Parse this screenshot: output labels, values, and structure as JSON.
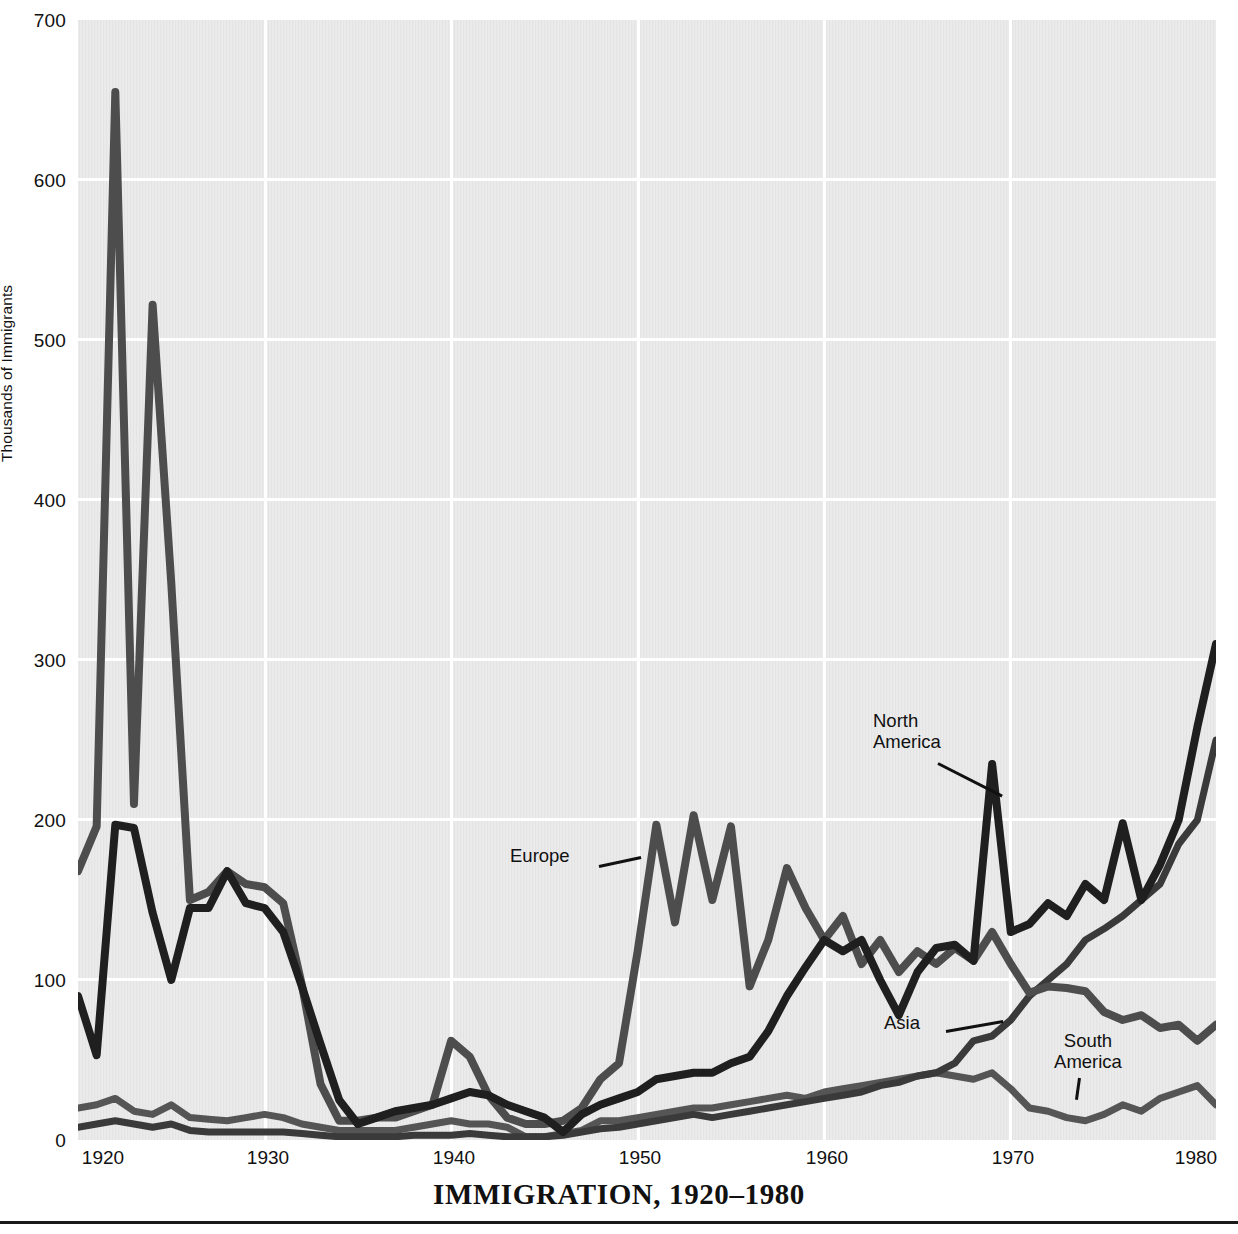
{
  "caption": "IMMIGRATION, 1920–1980",
  "axes": {
    "ylabel": "Thousands of Immigrants",
    "y_ticks": [
      0,
      100,
      200,
      300,
      400,
      500,
      600,
      700
    ],
    "x_ticks": [
      1920,
      1930,
      1940,
      1950,
      1960,
      1970,
      1980
    ],
    "xlim": [
      1919,
      1980
    ],
    "ylim": [
      0,
      700
    ]
  },
  "annotations": [
    {
      "name": "europe",
      "label": "Europe"
    },
    {
      "name": "north-america",
      "label": "North\nAmerica"
    },
    {
      "name": "asia",
      "label": "Asia"
    },
    {
      "name": "south-america",
      "label": "South\nAmerica"
    }
  ],
  "colors": {
    "plot_background": "#e4e4e4",
    "gridline": "#ffffff",
    "europe": "#4d4d4d",
    "north_america": "#1f1f1f",
    "asia": "#3a3a3a",
    "south_america": "#555555",
    "text": "#111111",
    "rule": "#1a1a1a"
  },
  "chart_data": {
    "type": "line",
    "title": "IMMIGRATION, 1920–1980",
    "xlabel": "",
    "ylabel": "Thousands of Immigrants",
    "xlim": [
      1919,
      1980
    ],
    "ylim": [
      0,
      700
    ],
    "grid": true,
    "legend": "in-plot annotations",
    "x": [
      1919,
      1920,
      1921,
      1922,
      1923,
      1924,
      1925,
      1926,
      1927,
      1928,
      1929,
      1930,
      1931,
      1932,
      1933,
      1934,
      1935,
      1936,
      1937,
      1938,
      1939,
      1940,
      1941,
      1942,
      1943,
      1944,
      1945,
      1946,
      1947,
      1948,
      1949,
      1950,
      1951,
      1952,
      1953,
      1954,
      1955,
      1956,
      1957,
      1958,
      1959,
      1960,
      1961,
      1962,
      1963,
      1964,
      1965,
      1966,
      1967,
      1968,
      1969,
      1970,
      1971,
      1972,
      1973,
      1974,
      1975,
      1976,
      1977,
      1978,
      1979,
      1980
    ],
    "series": [
      {
        "name": "Europe",
        "color": "#4d4d4d",
        "values": [
          168,
          196,
          655,
          210,
          522,
          348,
          150,
          155,
          168,
          160,
          158,
          148,
          97,
          35,
          12,
          12,
          14,
          14,
          18,
          22,
          62,
          52,
          28,
          14,
          10,
          10,
          12,
          20,
          38,
          48,
          118,
          197,
          136,
          203,
          150,
          196,
          96,
          125,
          170,
          145,
          125,
          140,
          110,
          125,
          105,
          118,
          110,
          120,
          112,
          130,
          110,
          92,
          96,
          95,
          93,
          80,
          75,
          78,
          70,
          72,
          62,
          72
        ]
      },
      {
        "name": "North America",
        "color": "#1f1f1f",
        "values": [
          90,
          53,
          197,
          195,
          142,
          100,
          145,
          145,
          168,
          148,
          145,
          130,
          96,
          60,
          25,
          10,
          14,
          18,
          20,
          22,
          26,
          30,
          28,
          22,
          18,
          14,
          5,
          16,
          22,
          26,
          30,
          38,
          40,
          42,
          42,
          48,
          52,
          68,
          90,
          108,
          125,
          118,
          125,
          100,
          78,
          105,
          120,
          122,
          112,
          235,
          130,
          135,
          148,
          140,
          160,
          150,
          198,
          150,
          172,
          200,
          258,
          310
        ]
      },
      {
        "name": "Asia",
        "color": "#3a3a3a",
        "values": [
          8,
          10,
          12,
          10,
          8,
          10,
          6,
          5,
          5,
          5,
          5,
          5,
          4,
          3,
          2,
          2,
          2,
          2,
          3,
          3,
          3,
          4,
          3,
          2,
          2,
          2,
          3,
          5,
          7,
          8,
          10,
          12,
          14,
          16,
          14,
          16,
          18,
          20,
          22,
          24,
          26,
          28,
          30,
          34,
          36,
          40,
          42,
          48,
          62,
          65,
          75,
          90,
          100,
          110,
          125,
          132,
          140,
          150,
          160,
          185,
          200,
          250
        ]
      },
      {
        "name": "South America",
        "color": "#555555",
        "values": [
          20,
          22,
          26,
          18,
          16,
          22,
          14,
          13,
          12,
          14,
          16,
          14,
          10,
          8,
          6,
          6,
          6,
          6,
          8,
          10,
          12,
          10,
          10,
          8,
          2,
          2,
          4,
          6,
          12,
          12,
          14,
          16,
          18,
          20,
          20,
          22,
          24,
          26,
          28,
          26,
          30,
          32,
          34,
          36,
          38,
          40,
          42,
          40,
          38,
          42,
          32,
          20,
          18,
          14,
          12,
          16,
          22,
          18,
          26,
          30,
          34,
          22
        ]
      }
    ]
  }
}
